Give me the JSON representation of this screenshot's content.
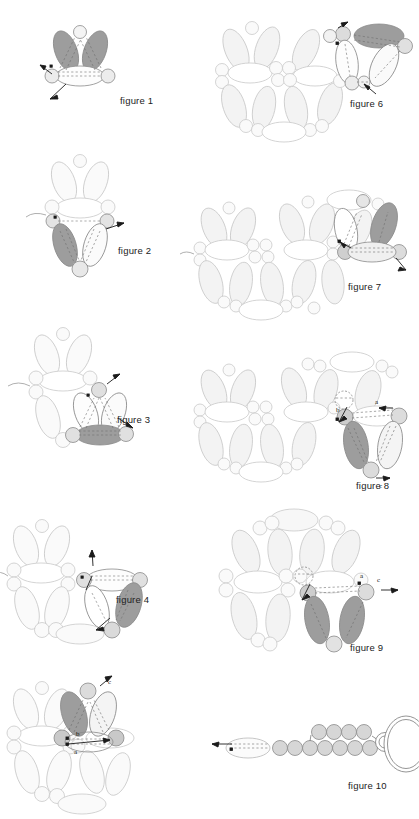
{
  "document": {
    "kind": "beadwork-instruction-diagram",
    "page_background": "#ffffff",
    "figure_count": 10
  },
  "palette": {
    "bead_dark_fill": "#9d9d9d",
    "bead_mid_fill": "#bdbdbd",
    "bead_light_fill": "#f2f2f2",
    "bead_white_fill": "#ffffff",
    "bead_seed_fill": "#d8d8d8",
    "outline": "#8a8a8a",
    "outline_light": "#c9c9c9",
    "thread": "#5a5a5a",
    "label_text": "#222222"
  },
  "figures": [
    {
      "id": "figure-1",
      "label": "figure 1",
      "label_x": 120,
      "label_y": 101,
      "origin_x": 30,
      "origin_y": 6,
      "description": "Three drop beads forming a triangle unit with two thread arrows",
      "point_labels": []
    },
    {
      "id": "figure-2",
      "label": "figure 2",
      "label_x": 118,
      "label_y": 251,
      "origin_x": 28,
      "origin_y": 150,
      "description": "Second unit added below the first triangle, one bead shaded dark",
      "point_labels": []
    },
    {
      "id": "figure-3",
      "label": "figure 3",
      "label_x": 117,
      "label_y": 420,
      "origin_x": 12,
      "origin_y": 320,
      "description": "Third unit joined to the growing rosette, lower bead shaded dark",
      "point_labels": []
    },
    {
      "id": "figure-4",
      "label": "figure 4",
      "label_x": 116,
      "label_y": 600,
      "origin_x": 6,
      "origin_y": 492,
      "description": "Fourth unit closing the circle of the rosette",
      "point_labels": []
    },
    {
      "id": "figure-5",
      "label": "",
      "label_x": 0,
      "label_y": 0,
      "origin_x": 2,
      "origin_y": 676,
      "description": "Partial figure cropped by the bottom page edge; thread paths a and b marked",
      "point_labels": [
        "b",
        "a",
        "c"
      ]
    },
    {
      "id": "figure-6",
      "label": "figure 6",
      "label_x": 350,
      "label_y": 104,
      "origin_x": 214,
      "origin_y": 6,
      "description": "Completed rosette with a new unit being added at the right side",
      "point_labels": []
    },
    {
      "id": "figure-7",
      "label": "figure 7",
      "label_x": 348,
      "label_y": 287,
      "origin_x": 198,
      "origin_y": 192,
      "description": "Two joined rosettes with a new unit worked off the right edge",
      "point_labels": []
    },
    {
      "id": "figure-8",
      "label": "figure 8",
      "label_x": 356,
      "label_y": 486,
      "origin_x": 198,
      "origin_y": 352,
      "description": "Two rosettes with a third unit begun; thread exits marked a, b and c",
      "point_labels": [
        "a",
        "b",
        "c"
      ]
    },
    {
      "id": "figure-9",
      "label": "figure 9",
      "label_x": 350,
      "label_y": 648,
      "origin_x": 222,
      "origin_y": 500,
      "description": "Rosette with two dark drop beads added at the lower right; points a and c marked",
      "point_labels": [
        "a",
        "c"
      ]
    },
    {
      "id": "figure-10",
      "label": "figure 10",
      "label_x": 348,
      "label_y": 786,
      "origin_x": 222,
      "origin_y": 700,
      "description": "Clasp finishing: two rows of seed beads ending in a soldered jump ring and oval ring",
      "point_labels": []
    }
  ],
  "annotations": {
    "fig5_b": "b",
    "fig5_a": "a",
    "fig5_c": "c",
    "fig8_a": "a",
    "fig8_b": "b",
    "fig8_c": "c",
    "fig9_a": "a",
    "fig9_c": "c"
  }
}
